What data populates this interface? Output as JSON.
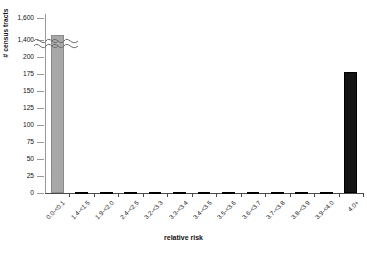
{
  "chart_data": {
    "type": "bar",
    "title": "",
    "xlabel": "relative risk",
    "ylabel": "# census tracts",
    "categories": [
      "0.0-<0.1",
      "1.4-<1.5",
      "1.9-<2.0",
      "2.4-<2.5",
      "3.2-<3.3",
      "3.3-<3.4",
      "3.4-<3.5",
      "3.5-<3.6",
      "3.6-<3.7",
      "3.7-<3.8",
      "3.8-<3.9",
      "3.9-<4.0",
      "4.0+"
    ],
    "values": [
      1450,
      1,
      1,
      1,
      1,
      1,
      1,
      1,
      1,
      1,
      1,
      1,
      178
    ],
    "bar_colors": [
      "#a8a8a8",
      "#141414",
      "#141414",
      "#141414",
      "#141414",
      "#141414",
      "#141414",
      "#141414",
      "#141414",
      "#141414",
      "#141414",
      "#141414",
      "#141414"
    ],
    "ylim": [
      0,
      1600
    ],
    "yticks": [
      0,
      25,
      50,
      75,
      100,
      125,
      150,
      175,
      200,
      1400,
      1600
    ],
    "ytick_labels": [
      "0",
      "25",
      "50",
      "75",
      "100",
      "125",
      "150",
      "175",
      "200",
      "1,400",
      "1,600"
    ],
    "axis_break": {
      "present": true,
      "below": 200,
      "above": 1400
    },
    "grid": false,
    "legend": null
  },
  "axis": {
    "y_title": "# census tracts",
    "x_title": "relative risk"
  }
}
